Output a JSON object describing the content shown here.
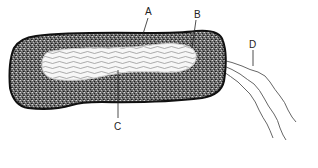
{
  "diagram": {
    "type": "bacterial-cell",
    "labels": {
      "A": "A",
      "B": "B",
      "C": "C",
      "D": "D"
    },
    "colors": {
      "outline": "#111111",
      "stipple_dark": "#3a3a3a",
      "stipple_light": "#8a8a8a",
      "nucleoid_fill": "#f4f4f4",
      "line": "#333333"
    }
  }
}
